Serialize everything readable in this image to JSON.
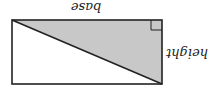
{
  "diagram": {
    "orientation": "rotated-180",
    "labels": {
      "base": "base",
      "height": "height"
    },
    "shapes": {
      "rectangle": {
        "x": 12,
        "y": 20,
        "width": 150,
        "height": 64
      },
      "shaded_triangle": {
        "points": "12,20 162,20 162,84",
        "fill": "#c8c8c8"
      },
      "right_angle_marker": {
        "x": 151,
        "y": 20,
        "size": 11
      }
    },
    "colors": {
      "stroke": "#222222",
      "fill": "#c8c8c8"
    }
  }
}
